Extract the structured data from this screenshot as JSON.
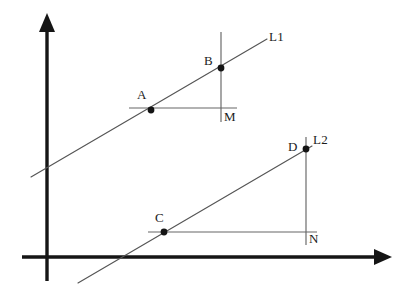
{
  "figure": {
    "background_color": "#ffffff",
    "axis_color": "#151515",
    "line_color": "#555555",
    "point_color": "#141414",
    "label_color": "#1b1b1b"
  },
  "axes": {
    "origin": {
      "x": 47,
      "y": 257
    },
    "y_axis": {
      "label": "",
      "top": {
        "x": 47,
        "y": 15
      },
      "bottom": {
        "x": 47,
        "y": 281
      }
    },
    "x_axis": {
      "label": "",
      "left": {
        "x": 22,
        "y": 257
      },
      "right": {
        "x": 390,
        "y": 257
      }
    },
    "arrowheads": [
      "y-axis-up",
      "x-axis-right"
    ]
  },
  "lines": [
    {
      "id": "L1",
      "label": "L1",
      "label_pos": {
        "x": 269,
        "y": 30
      },
      "start": {
        "x": 31,
        "y": 177
      },
      "end": {
        "x": 267,
        "y": 39
      },
      "slope": 0.585
    },
    {
      "id": "L2",
      "label": "L2",
      "label_pos": {
        "x": 313,
        "y": 133
      },
      "start": {
        "x": 78,
        "y": 283
      },
      "end": {
        "x": 312,
        "y": 146
      },
      "slope": 0.585
    }
  ],
  "points": [
    {
      "id": "A",
      "label": "A",
      "x": 151,
      "y": 110,
      "label_pos": {
        "x": 137,
        "y": 88
      },
      "on_line": "L1"
    },
    {
      "id": "B",
      "label": "B",
      "x": 221,
      "y": 68,
      "label_pos": {
        "x": 204,
        "y": 54
      },
      "on_line": "L1"
    },
    {
      "id": "C",
      "label": "C",
      "x": 164,
      "y": 232,
      "label_pos": {
        "x": 155,
        "y": 211
      },
      "on_line": "L2"
    },
    {
      "id": "D",
      "label": "D",
      "x": 306,
      "y": 149,
      "label_pos": {
        "x": 288,
        "y": 140
      },
      "on_line": "L2"
    },
    {
      "id": "M",
      "label": "M",
      "x": 221,
      "y": 108,
      "label_pos": {
        "x": 224,
        "y": 110
      },
      "on_line": ""
    },
    {
      "id": "N",
      "label": "N",
      "x": 306,
      "y": 232,
      "label_pos": {
        "x": 309,
        "y": 232
      },
      "on_line": ""
    }
  ],
  "segments": [
    {
      "id": "AM",
      "orientation": "horizontal",
      "x1": 129,
      "y1": 108,
      "x2": 237,
      "y2": 108
    },
    {
      "id": "BM",
      "orientation": "vertical",
      "x1": 221,
      "y1": 32,
      "x2": 221,
      "y2": 122
    },
    {
      "id": "CN",
      "orientation": "horizontal",
      "x1": 148,
      "y1": 232,
      "x2": 317,
      "y2": 232
    },
    {
      "id": "DN",
      "orientation": "vertical",
      "x1": 306,
      "y1": 137,
      "x2": 306,
      "y2": 245
    }
  ]
}
